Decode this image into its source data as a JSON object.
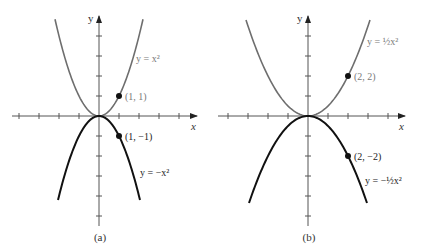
{
  "figure": {
    "panels": [
      {
        "id": "a",
        "caption": "(a)",
        "origin_px": [
          99,
          116
        ],
        "unit_px": 20,
        "x_axis_label": "x",
        "y_axis_label": "y",
        "x_range_px": [
          12,
          197
        ],
        "y_range_px": [
          16,
          226
        ],
        "x_ticks": [
          -4,
          -3,
          -2,
          -1,
          1,
          2,
          3,
          4
        ],
        "y_ticks": [
          -5,
          -4,
          -3,
          -2,
          -1,
          1,
          2,
          3,
          4
        ],
        "upper_curve": {
          "equation": "y = x²",
          "coef": 1,
          "x_extent": 2.2,
          "color": "#6e6e6e"
        },
        "lower_curve": {
          "equation": "y = −x²",
          "coef": -1,
          "x_extent": 2.05,
          "color": "#111111"
        },
        "points": [
          {
            "x": 1,
            "y": 1,
            "label": "(1, 1)"
          },
          {
            "x": 1,
            "y": -1,
            "label": "(1, −1)"
          }
        ],
        "upper_label_pos": [
          136,
          62
        ],
        "lower_label_pos": [
          140,
          176
        ]
      },
      {
        "id": "b",
        "caption": "(b)",
        "origin_px": [
          308,
          116
        ],
        "unit_px": 20,
        "x_axis_label": "x",
        "y_axis_label": "y",
        "x_range_px": [
          218,
          405
        ],
        "y_range_px": [
          16,
          226
        ],
        "x_ticks": [
          -4,
          -3,
          -2,
          -1,
          1,
          2,
          3,
          4
        ],
        "y_ticks": [
          -5,
          -4,
          -3,
          -2,
          -1,
          1,
          2,
          3,
          4
        ],
        "upper_curve": {
          "equation": "y = ½x²",
          "coef": 0.5,
          "x_extent": 3.1,
          "color": "#6e6e6e"
        },
        "lower_curve": {
          "equation": "y = −½x²",
          "coef": -0.5,
          "x_extent": 2.95,
          "color": "#111111"
        },
        "points": [
          {
            "x": 2,
            "y": 2,
            "label": "(2, 2)"
          },
          {
            "x": 2,
            "y": -2,
            "label": "(2, −2)"
          }
        ],
        "upper_label_pos": [
          367,
          45
        ],
        "lower_label_pos": [
          365,
          184
        ]
      }
    ]
  }
}
